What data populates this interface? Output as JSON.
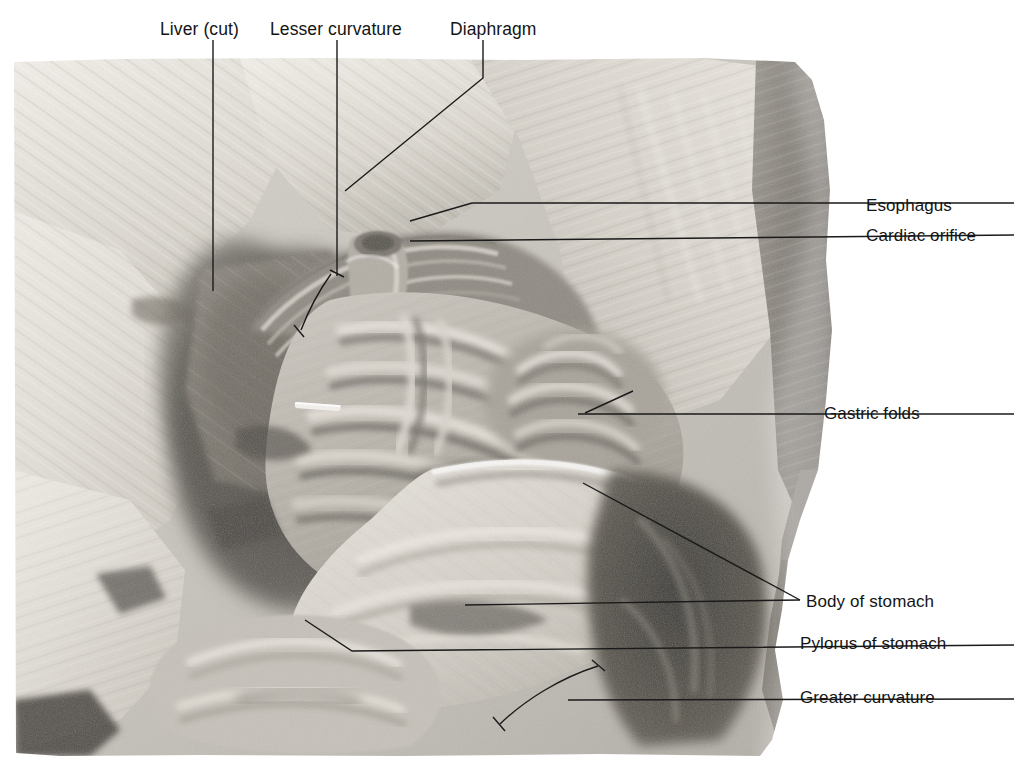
{
  "figure": {
    "kind": "anatomical-photograph",
    "modality": "black-and-white cadaver photograph",
    "photo_frame": {
      "left": 14,
      "top": 58,
      "right": 832,
      "bottom": 756
    },
    "background_color": "#ffffff",
    "text_color": "#141414",
    "leader_color": "#1a1a1a"
  },
  "labels": {
    "top": [
      {
        "id": "liver-cut",
        "text": "Liver (cut)",
        "x": 160,
        "y": 20
      },
      {
        "id": "lesser-curvature",
        "text": "Lesser curvature",
        "x": 270,
        "y": 20
      },
      {
        "id": "diaphragm",
        "text": "Diaphragm",
        "x": 450,
        "y": 20
      }
    ],
    "right": [
      {
        "id": "esophagus",
        "text": "Esophagus",
        "x": 866,
        "y": 196
      },
      {
        "id": "cardiac-orifice",
        "text": "Cardiac orifice",
        "x": 866,
        "y": 226
      },
      {
        "id": "gastric-folds",
        "text": "Gastric folds",
        "x": 824,
        "y": 404
      },
      {
        "id": "body-of-stomach",
        "text": "Body of stomach",
        "x": 806,
        "y": 592
      },
      {
        "id": "pylorus-of-stomach",
        "text": "Pylorus of stomach",
        "x": 800,
        "y": 634
      },
      {
        "id": "greater-curvature",
        "text": "Greater curvature",
        "x": 800,
        "y": 688
      }
    ]
  },
  "leaders": {
    "liver_cut": "M213,40 L213,291",
    "lesser_curvature": "M337,40 L337,276",
    "lesser_bracket": "M331,274 C318,292 308,312 301,330",
    "lesser_tick_top": "M330,270 L344,276",
    "lesser_tick_bot": "M294,326 L303,336",
    "diaphragm": "M483,40 L483,78 L345,191",
    "esophagus": "M1014,203 L472,203 L410,220",
    "cardiac_orifice": "M1014,235 L410,241",
    "gastric_folds": "M1014,414 L578,414",
    "gastric_folds_br": "M633,391 L584,414",
    "body_diag": "M800,600 L583,483",
    "body_horiz": "M800,600 L465,605",
    "pylorus": "M1014,645 L352,651 L305,620",
    "greater_line": "M1014,699 L568,700",
    "greater_bracket": "M598,666 C560,678 525,700 500,724",
    "greater_tick_top": "M593,661 L604,670",
    "greater_tick_bot": "M494,718 L504,730"
  }
}
